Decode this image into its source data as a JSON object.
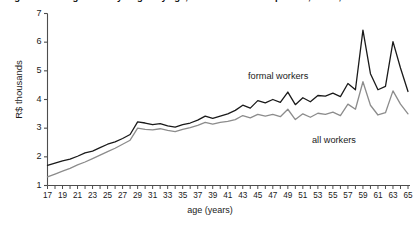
{
  "figure": {
    "number_label": "Figure 4.",
    "title": "Figure 4.  Average monthly wages by age, formal and all occupations, Brazil, 2008",
    "title_visible_fragment": "Average monthly wages by age, formal and all occupations, Brazil, 2008"
  },
  "axes": {
    "ylabel": "R$ thousands",
    "xlabel": "age (years)",
    "yticks": [
      "1",
      "2",
      "3",
      "4",
      "5",
      "6",
      "7"
    ],
    "xticks": [
      "17",
      "19",
      "21",
      "23",
      "25",
      "27",
      "29",
      "31",
      "33",
      "35",
      "37",
      "39",
      "41",
      "43",
      "45",
      "47",
      "49",
      "51",
      "53",
      "55",
      "57",
      "59",
      "61",
      "63",
      "65"
    ]
  },
  "legend": {
    "formal_label": "formal workers",
    "all_label": "all workers"
  },
  "colors": {
    "formal": "#1a1a1a",
    "all": "#8c8c8c",
    "axis": "#4d4d4d",
    "background": "#ffffff"
  },
  "chart_data": {
    "type": "line",
    "title": "Average monthly wages by age, formal and all occupations, Brazil, 2008",
    "xlabel": "age (years)",
    "ylabel": "R$ thousands",
    "xlim": [
      17,
      65
    ],
    "ylim": [
      1,
      7
    ],
    "grid": false,
    "legend_position": "inline-annotations",
    "x": [
      17,
      18,
      19,
      20,
      21,
      22,
      23,
      24,
      25,
      26,
      27,
      28,
      29,
      30,
      31,
      32,
      33,
      34,
      35,
      36,
      37,
      38,
      39,
      40,
      41,
      42,
      43,
      44,
      45,
      46,
      47,
      48,
      49,
      50,
      51,
      52,
      53,
      54,
      55,
      56,
      57,
      58,
      59,
      60,
      61,
      62,
      63,
      64,
      65
    ],
    "series": [
      {
        "name": "formal workers",
        "color": "#1a1a1a",
        "values": [
          1.7,
          1.78,
          1.86,
          1.92,
          2.02,
          2.14,
          2.2,
          2.32,
          2.44,
          2.52,
          2.64,
          2.78,
          3.22,
          3.18,
          3.12,
          3.16,
          3.08,
          3.04,
          3.12,
          3.18,
          3.28,
          3.42,
          3.34,
          3.42,
          3.5,
          3.62,
          3.8,
          3.7,
          3.96,
          3.88,
          4.0,
          3.9,
          4.26,
          3.82,
          4.06,
          3.92,
          4.14,
          4.12,
          4.22,
          4.1,
          4.56,
          4.34,
          6.42,
          4.9,
          4.34,
          4.46,
          6.02,
          5.1,
          4.28
        ]
      },
      {
        "name": "all workers",
        "color": "#8c8c8c",
        "values": [
          1.3,
          1.4,
          1.5,
          1.6,
          1.72,
          1.82,
          1.94,
          2.06,
          2.18,
          2.3,
          2.44,
          2.58,
          3.0,
          2.96,
          2.94,
          2.98,
          2.92,
          2.88,
          2.96,
          3.02,
          3.1,
          3.2,
          3.14,
          3.2,
          3.24,
          3.3,
          3.44,
          3.36,
          3.48,
          3.42,
          3.48,
          3.4,
          3.66,
          3.3,
          3.5,
          3.38,
          3.52,
          3.48,
          3.56,
          3.44,
          3.84,
          3.66,
          4.62,
          3.8,
          3.46,
          3.54,
          4.3,
          3.84,
          3.5
        ]
      }
    ]
  }
}
